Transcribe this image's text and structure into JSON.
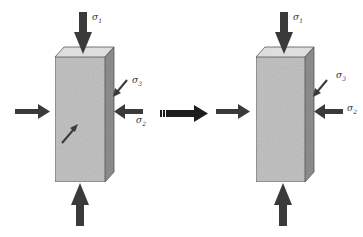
{
  "diagram": {
    "colors": {
      "arrow": "#3a3a3a",
      "block_front": "#c4c4c4",
      "block_top": "#dedede",
      "block_side": "#8a8a8a",
      "outline": "#555555"
    },
    "left_specimen": {
      "labels": {
        "sigma1": "σ",
        "sigma1_sub": "1",
        "sigma2": "σ",
        "sigma2_sub": "2",
        "sigma3": "σ",
        "sigma3_sub": "3"
      },
      "arrows": [
        "top-down σ1",
        "bottom-up σ1",
        "left σ2",
        "right σ2",
        "side-diagonal σ3",
        "front-diagonal σ3"
      ]
    },
    "transition_arrow": "transition-arrow",
    "right_specimen": {
      "labels": {
        "sigma1": "σ",
        "sigma1_sub": "1",
        "sigma2": "σ",
        "sigma2_sub": "2",
        "sigma3": "σ",
        "sigma3_sub": "3"
      },
      "arrows": [
        "top-down σ1",
        "bottom-up σ1",
        "left σ2",
        "right σ2",
        "side-diagonal σ3"
      ]
    }
  }
}
